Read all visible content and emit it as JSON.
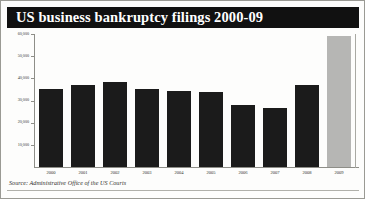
{
  "figure": {
    "title": "US business bankruptcy filings 2000-09",
    "source_note": "Source: Administrative Office of the US Courts",
    "colors": {
      "title_bar_background": "#111111",
      "title_text": "#ffffff",
      "bar": "#1b1b1b",
      "bar_highlight": "#b6b6b4",
      "axis": "#8e8e88",
      "panel_background": "#fdfdfc",
      "frame_border": "#9a9a94"
    }
  },
  "chart_data": {
    "type": "bar",
    "title": "US business bankruptcy filings 2000-09",
    "xlabel": "",
    "ylabel": "",
    "categories": [
      "2000",
      "2001",
      "2002",
      "2003",
      "2004",
      "2005",
      "2006",
      "2007",
      "2008",
      "2009"
    ],
    "values": [
      35000,
      37000,
      38500,
      35000,
      34500,
      34000,
      28000,
      26500,
      37000,
      59000
    ],
    "series": [
      {
        "name": "Business bankruptcy filings",
        "values": [
          35000,
          37000,
          38500,
          35000,
          34500,
          34000,
          28000,
          26500,
          37000,
          59000
        ]
      }
    ],
    "highlight_category": "2009",
    "ylim": [
      0,
      60000
    ],
    "yticks": [
      10000,
      20000,
      30000,
      40000,
      50000,
      60000
    ],
    "ytick_labels": [
      "10,000",
      "20,000",
      "30,000",
      "40,000",
      "50,000",
      "60,000"
    ],
    "grid": false,
    "legend": "none",
    "legend_position": "none"
  }
}
